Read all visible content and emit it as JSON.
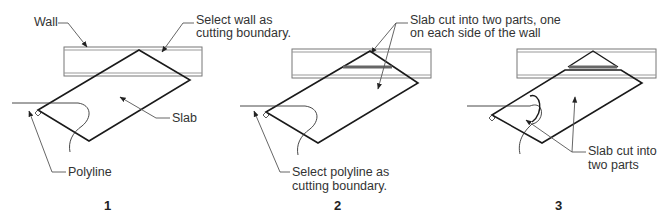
{
  "figure": {
    "panels": [
      {
        "number": "1",
        "labels": {
          "wall": "Wall",
          "select_wall_line1": "Select wall as",
          "select_wall_line2": "cutting boundary.",
          "slab": "Slab",
          "polyline": "Polyline"
        }
      },
      {
        "number": "2",
        "labels": {
          "slab_cut_line1": "Slab cut into two parts, one",
          "slab_cut_line2": "on each side of the wall",
          "select_polyline_line1": "Select polyline as",
          "select_polyline_line2": "cutting boundary."
        }
      },
      {
        "number": "3",
        "labels": {
          "slab_cut_line1": "Slab cut into",
          "slab_cut_line2": "two parts"
        }
      }
    ],
    "colors": {
      "line": "#1a1a1a",
      "leader": "#555555",
      "wall_edge": "#777777",
      "cut_bar": "#666666",
      "text": "#333333"
    }
  }
}
